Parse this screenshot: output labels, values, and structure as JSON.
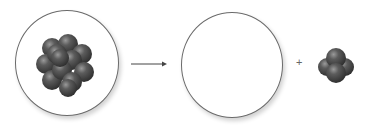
{
  "diagram": {
    "type": "nuclear-decay",
    "reactant": {
      "label": "parent nucleus",
      "icon": "nucleus-cluster-icon"
    },
    "arrow": {
      "icon": "right-arrow-icon"
    },
    "product_1": {
      "label": "daughter nucleus (empty)",
      "icon": "empty-circle"
    },
    "operator": "+",
    "product_2": {
      "label": "alpha particle",
      "icon": "alpha-particle-icon"
    },
    "colors": {
      "sphere": "#4a4a4a",
      "outline": "#6a6a6a",
      "background": "#ffffff"
    }
  }
}
